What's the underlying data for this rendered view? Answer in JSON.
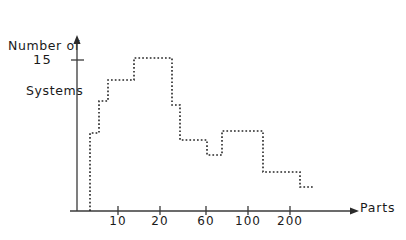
{
  "chart_data": {
    "type": "bar",
    "title": "",
    "subtitle": "",
    "xlabel": "Parts",
    "ylabel": "Number of Systems",
    "ylabel_line1": "Number of",
    "ylabel_line2": "Systems",
    "style": "dotted step histogram",
    "grid": false,
    "legend": null,
    "x_scale": "log",
    "x_tick_labels": [
      "10",
      "20",
      "60",
      "100",
      "200"
    ],
    "x_tick_values": [
      10,
      20,
      60,
      100,
      200
    ],
    "y_tick_labels": [
      "15"
    ],
    "y_tick_values": [
      15
    ],
    "ylim": [
      0,
      17
    ],
    "axis_arrows": {
      "x": "right",
      "y": "up"
    },
    "bins": [
      {
        "x_start": 5,
        "x_end": 7,
        "value": 7.7
      },
      {
        "x_start": 7,
        "x_end": 9,
        "value": 10.9
      },
      {
        "x_start": 9,
        "x_end": 14,
        "value": 13.0
      },
      {
        "x_start": 14,
        "x_end": 27,
        "value": 15.0
      },
      {
        "x_start": 27,
        "x_end": 32,
        "value": 10.5
      },
      {
        "x_start": 32,
        "x_end": 60,
        "value": 7.0
      },
      {
        "x_start": 60,
        "x_end": 78,
        "value": 5.5
      },
      {
        "x_start": 78,
        "x_end": 130,
        "value": 7.9
      },
      {
        "x_start": 130,
        "x_end": 250,
        "value": 3.9
      },
      {
        "x_start": 250,
        "x_end": 330,
        "value": 2.4
      }
    ],
    "values": [
      7.7,
      10.9,
      13.0,
      15.0,
      10.5,
      7.0,
      5.5,
      7.9,
      3.9,
      2.4
    ],
    "categories": [
      "5-7",
      "7-9",
      "9-14",
      "14-27",
      "27-32",
      "32-60",
      "60-78",
      "78-130",
      "130-250",
      "250-330"
    ],
    "colors": {
      "line": "#262626",
      "axis": "#3a3a3a",
      "background": "#ffffff"
    },
    "pixel_geometry": {
      "axis_x": 77,
      "axis_y": 211,
      "y_axis_top": 37,
      "x_axis_right": 358,
      "y_tick_15_px": 60,
      "x_ticks_px": [
        118,
        160,
        206,
        248,
        290
      ],
      "step_points_px": [
        [
          90,
          211
        ],
        [
          90,
          133
        ],
        [
          99,
          133
        ],
        [
          99,
          101
        ],
        [
          108,
          101
        ],
        [
          108,
          80
        ],
        [
          134,
          80
        ],
        [
          134,
          58
        ],
        [
          172,
          58
        ],
        [
          172,
          105
        ],
        [
          180,
          105
        ],
        [
          180,
          140
        ],
        [
          207,
          140
        ],
        [
          207,
          155
        ],
        [
          222,
          155
        ],
        [
          222,
          131
        ],
        [
          263,
          131
        ],
        [
          263,
          172
        ],
        [
          300,
          172
        ],
        [
          300,
          187
        ],
        [
          313,
          187
        ]
      ]
    }
  }
}
